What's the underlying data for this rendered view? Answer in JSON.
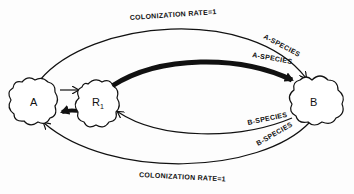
{
  "diagram": {
    "type": "flow-diagram",
    "colors": {
      "ink": "#111111",
      "background": "#fdfdfd"
    },
    "nodes": [
      {
        "id": "A",
        "label": "A"
      },
      {
        "id": "R1",
        "label": "R",
        "subscript": "1"
      },
      {
        "id": "B",
        "label": "B"
      }
    ],
    "edges": [
      {
        "from": "A",
        "to": "B",
        "weight": "thin",
        "route": "outer-top",
        "labels": [
          "COLONIZATION RATE=1",
          "A-SPECIES"
        ]
      },
      {
        "from": "R1",
        "to": "B",
        "weight": "thick",
        "route": "inner-top",
        "labels": [
          "A-SPECIES"
        ]
      },
      {
        "from": "A",
        "to": "R1",
        "weight": "thin",
        "route": "direct"
      },
      {
        "from": "R1",
        "to": "A",
        "weight": "thick",
        "route": "direct"
      },
      {
        "from": "B",
        "to": "R1",
        "weight": "thin",
        "route": "inner-bottom",
        "labels": [
          "B-SPECIES"
        ]
      },
      {
        "from": "B",
        "to": "A",
        "weight": "thin",
        "route": "outer-bottom",
        "labels": [
          "B-SPECIES",
          "COLONIZATION RATE=1"
        ]
      }
    ],
    "labels": {
      "top_rate": "COLONIZATION RATE=1",
      "top_outer_species": "A-SPECIES",
      "top_inner_species": "A-SPECIES",
      "bottom_inner_species": "B-SPECIES",
      "bottom_outer_species": "B-SPECIES",
      "bottom_rate": "COLONIZATION RATE=1"
    }
  }
}
